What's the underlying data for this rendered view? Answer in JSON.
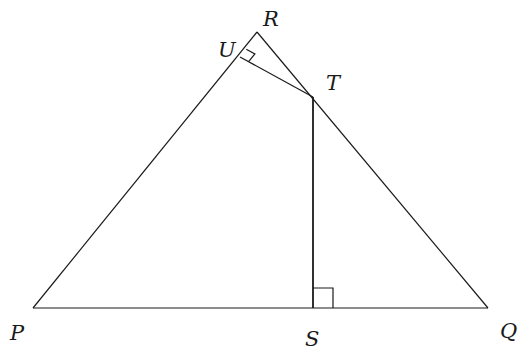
{
  "diagram": {
    "type": "geometry",
    "points": {
      "P": {
        "label": "P",
        "x": 33,
        "y": 308
      },
      "Q": {
        "label": "Q",
        "x": 488,
        "y": 308
      },
      "R": {
        "label": "R",
        "x": 257,
        "y": 32
      },
      "S": {
        "label": "S",
        "x": 313,
        "y": 308
      },
      "T": {
        "label": "T",
        "x": 313,
        "y": 97
      },
      "U": {
        "label": "U",
        "x": 240,
        "y": 57
      }
    },
    "segments": [
      [
        "P",
        "R"
      ],
      [
        "R",
        "Q"
      ],
      [
        "P",
        "Q"
      ],
      [
        "U",
        "T"
      ],
      [
        "T",
        "S"
      ]
    ],
    "right_angles": [
      {
        "at": "U",
        "between": [
          "R",
          "T"
        ]
      },
      {
        "at": "S",
        "between": [
          "T",
          "Q"
        ]
      }
    ],
    "labels": {
      "P": "P",
      "Q": "Q",
      "R": "R",
      "S": "S",
      "T": "T",
      "U": "U"
    }
  }
}
